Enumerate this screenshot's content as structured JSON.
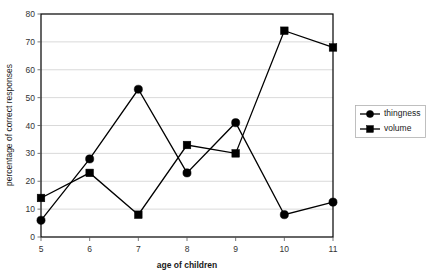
{
  "chart_data": {
    "type": "line",
    "title": "",
    "xlabel": "age of children",
    "ylabel": "percentage of correct responses",
    "x": [
      5,
      6,
      7,
      8,
      9,
      10,
      11
    ],
    "categories": [
      "5",
      "6",
      "7",
      "8",
      "9",
      "10",
      "11"
    ],
    "xlim": [
      5,
      11
    ],
    "ylim": [
      0,
      80
    ],
    "yticks": [
      0,
      10,
      20,
      30,
      40,
      50,
      60,
      70,
      80
    ],
    "ytick_labels": [
      "0",
      "10",
      "20",
      "30",
      "40",
      "50",
      "60",
      "70",
      "80"
    ],
    "xtick_labels": [
      "5",
      "6",
      "7",
      "8",
      "9",
      "10",
      "11"
    ],
    "grid": "horizontal",
    "legend_position": "right",
    "series": [
      {
        "name": "thingness",
        "marker": "circle",
        "color": "#000000",
        "values": [
          6,
          28,
          53,
          23,
          41,
          8,
          12.5
        ]
      },
      {
        "name": "volume",
        "marker": "square",
        "color": "#000000",
        "values": [
          14,
          23,
          8,
          33,
          30,
          74,
          68
        ]
      }
    ]
  },
  "legend": {
    "entries": [
      {
        "label": "thingness",
        "marker": "circle-marker-icon"
      },
      {
        "label": "volume",
        "marker": "square-marker-icon"
      }
    ]
  },
  "axes": {
    "x_title": "age of children",
    "y_title": "percentage of correct responses"
  }
}
